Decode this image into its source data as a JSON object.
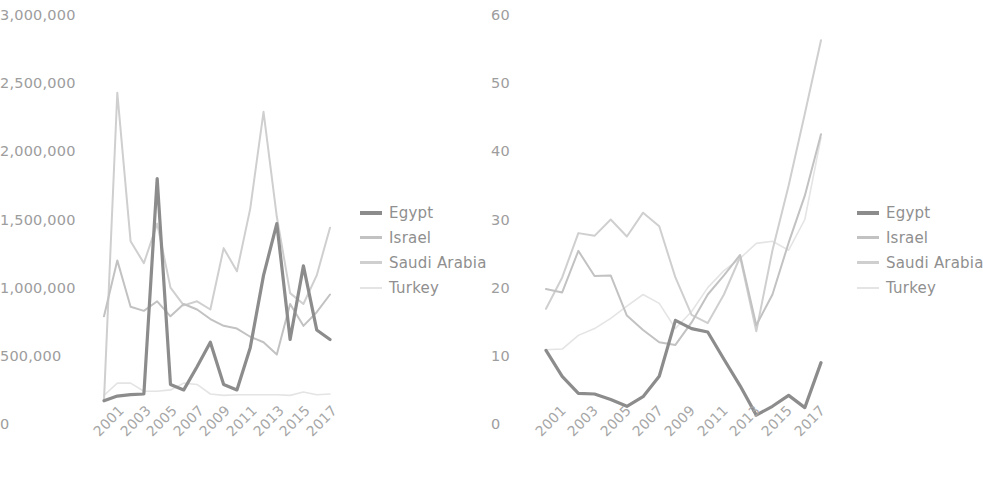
{
  "figure": {
    "background": "#ffffff",
    "series_colors": {
      "Egypt": "#8c8c8c",
      "Israel": "#c2c2c2",
      "Saudi Arabia": "#cfcfcf",
      "Turkey": "#e4e4e4"
    },
    "series_widths": {
      "Egypt": 3.2,
      "Israel": 2.0,
      "Saudi Arabia": 2.0,
      "Turkey": 1.6
    }
  },
  "legend": {
    "position": "right",
    "entries": [
      {
        "label": "Egypt",
        "color": "#8c8c8c",
        "width": 4
      },
      {
        "label": "Israel",
        "color": "#c2c2c2",
        "width": 3
      },
      {
        "label": "Saudi Arabia",
        "color": "#cfcfcf",
        "width": 3
      },
      {
        "label": "Turkey",
        "color": "#e4e4e4",
        "width": 2
      }
    ]
  },
  "chart_data": [
    {
      "id": "left",
      "type": "line",
      "title": "",
      "xlabel": "",
      "ylabel": "",
      "grid": false,
      "legend_position": "right",
      "x": [
        2001,
        2002,
        2003,
        2004,
        2005,
        2006,
        2007,
        2008,
        2009,
        2010,
        2011,
        2012,
        2013,
        2014,
        2015,
        2016,
        2017,
        2018
      ],
      "xtick_labels": [
        "2001",
        "2003",
        "2005",
        "2007",
        "2009",
        "2011",
        "2013",
        "2015",
        "2017"
      ],
      "ytick_labels": [
        "0",
        "500,000",
        "1,000,000",
        "1,500,000",
        "2,000,000",
        "2,500,000",
        "3,000,000"
      ],
      "ylim": [
        0,
        3000000
      ],
      "yticks": [
        0,
        500000,
        1000000,
        1500000,
        2000000,
        2500000,
        3000000
      ],
      "series": [
        {
          "name": "Egypt",
          "values": [
            170000,
            205000,
            215000,
            220000,
            1800000,
            290000,
            250000,
            420000,
            600000,
            290000,
            250000,
            560000,
            1090000,
            1470000,
            620000,
            1160000,
            690000,
            620000
          ]
        },
        {
          "name": "Israel",
          "values": [
            790000,
            1200000,
            860000,
            830000,
            900000,
            790000,
            880000,
            840000,
            770000,
            720000,
            700000,
            640000,
            600000,
            510000,
            880000,
            720000,
            820000,
            950000
          ]
        },
        {
          "name": "Saudi Arabia",
          "values": [
            175000,
            2430000,
            1340000,
            1180000,
            1470000,
            1000000,
            870000,
            900000,
            840000,
            1290000,
            1120000,
            1580000,
            2290000,
            1520000,
            960000,
            880000,
            1090000,
            1440000
          ]
        },
        {
          "name": "Turkey",
          "values": [
            210000,
            300000,
            300000,
            240000,
            240000,
            250000,
            300000,
            290000,
            220000,
            210000,
            215000,
            215000,
            215000,
            215000,
            210000,
            235000,
            215000,
            220000
          ]
        }
      ]
    },
    {
      "id": "right",
      "type": "line",
      "title": "",
      "xlabel": "",
      "ylabel": "",
      "grid": false,
      "legend_position": "right",
      "x": [
        2001,
        2002,
        2003,
        2004,
        2005,
        2006,
        2007,
        2008,
        2009,
        2010,
        2011,
        2012,
        2013,
        2014,
        2015,
        2016,
        2017,
        2018
      ],
      "xtick_labels": [
        "2001",
        "2003",
        "2005",
        "2007",
        "2009",
        "2011",
        "2013",
        "2015",
        "2017"
      ],
      "ytick_labels": [
        "0",
        "10",
        "20",
        "30",
        "40",
        "50",
        "60"
      ],
      "ylim": [
        0,
        60
      ],
      "yticks": [
        0,
        10,
        20,
        30,
        40,
        50,
        60
      ],
      "series": [
        {
          "name": "Egypt",
          "values": [
            10.8,
            7.0,
            4.5,
            4.4,
            3.6,
            2.6,
            4.0,
            7.0,
            15.2,
            14.0,
            13.5,
            9.5,
            5.6,
            1.3,
            2.6,
            4.2,
            2.4,
            9.0
          ]
        },
        {
          "name": "Israel",
          "values": [
            19.8,
            19.3,
            25.4,
            21.7,
            21.8,
            15.9,
            13.8,
            12.0,
            11.6,
            14.9,
            19.0,
            21.8,
            24.8,
            14.5,
            19.0,
            26.6,
            33.5,
            42.5
          ]
        },
        {
          "name": "Saudi Arabia",
          "values": [
            16.9,
            21.5,
            28.0,
            27.6,
            30.0,
            27.5,
            31.0,
            29.0,
            21.5,
            16.0,
            14.8,
            19.0,
            24.5,
            13.6,
            25.5,
            35.0,
            45.5,
            56.3
          ]
        },
        {
          "name": "Turkey",
          "values": [
            10.9,
            11.0,
            13.0,
            14.0,
            15.5,
            17.3,
            19.0,
            17.7,
            14.0,
            16.5,
            20.0,
            22.5,
            24.3,
            26.5,
            26.8,
            25.5,
            30.0,
            42.0
          ]
        }
      ]
    }
  ]
}
